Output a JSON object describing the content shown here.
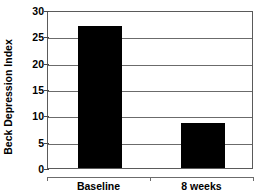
{
  "chart_data": {
    "type": "bar",
    "title": "",
    "xlabel": "",
    "ylabel": "Beck Depression Index",
    "categories": [
      "Baseline",
      "8 weeks"
    ],
    "values": [
      27,
      8.5
    ],
    "ylim": [
      0,
      30
    ],
    "yticks": [
      0,
      5,
      10,
      15,
      20,
      25,
      30
    ],
    "ytick_labels": [
      "0",
      "5",
      "10",
      "15",
      "20",
      "25",
      "30"
    ],
    "grid": true,
    "legend": false,
    "bar_color": "#000000",
    "axis_color": "#5a5a5a"
  }
}
